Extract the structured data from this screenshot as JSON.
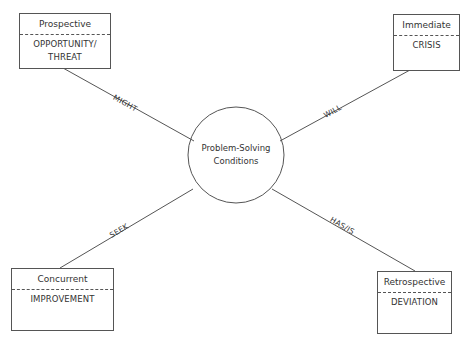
{
  "center": {
    "line1": "Problem-Solving",
    "line2": "Conditions"
  },
  "nodes": {
    "top_left": {
      "heading": "Prospective",
      "body_line1": "OPPORTUNITY/",
      "body_line2": "THREAT"
    },
    "top_right": {
      "heading": "Immediate",
      "body_line1": "CRISIS"
    },
    "bottom_left": {
      "heading": "Concurrent",
      "body_line1": "IMPROVEMENT"
    },
    "bottom_right": {
      "heading": "Retrospective",
      "body_line1": "DEVIATION"
    }
  },
  "edges": {
    "top_left": "MIGHT",
    "top_right": "WILL",
    "bottom_left": "SEEK",
    "bottom_right": "HAS/IS"
  },
  "colors": {
    "stroke": "#555555",
    "text": "#333333",
    "background": "#ffffff"
  }
}
